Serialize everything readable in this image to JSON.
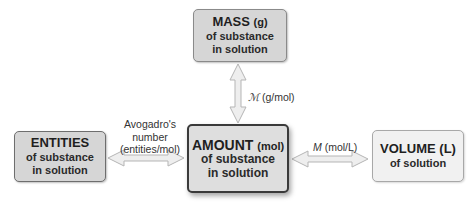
{
  "diagram": {
    "boxes": {
      "mass": {
        "title": "MASS",
        "unit": "(g)",
        "line2": "of substance",
        "line3": "in solution"
      },
      "entities": {
        "title": "ENTITIES",
        "line2": "of substance",
        "line3": "in solution"
      },
      "amount": {
        "title": "AMOUNT",
        "unit": "(mol)",
        "line2": "of substance",
        "line3": "in solution"
      },
      "volume": {
        "title": "VOLUME (L)",
        "line2": "of solution"
      }
    },
    "arrows": {
      "entities_amount": {
        "label_line1": "Avogadro's",
        "label_line2": "number",
        "label_line3": "(entities/mol)"
      },
      "mass_amount": {
        "symbol": "ℳ",
        "label": " (g/mol)"
      },
      "amount_volume": {
        "symbol": "M",
        "label": " (mol/L)"
      }
    },
    "colors": {
      "box_fill": "#d6d6d6",
      "amount_fill": "#dedede",
      "volume_fill": "#f1f1f1",
      "arrow_fill": "#eeeeee",
      "arrow_stroke": "#b5b5b5"
    }
  }
}
